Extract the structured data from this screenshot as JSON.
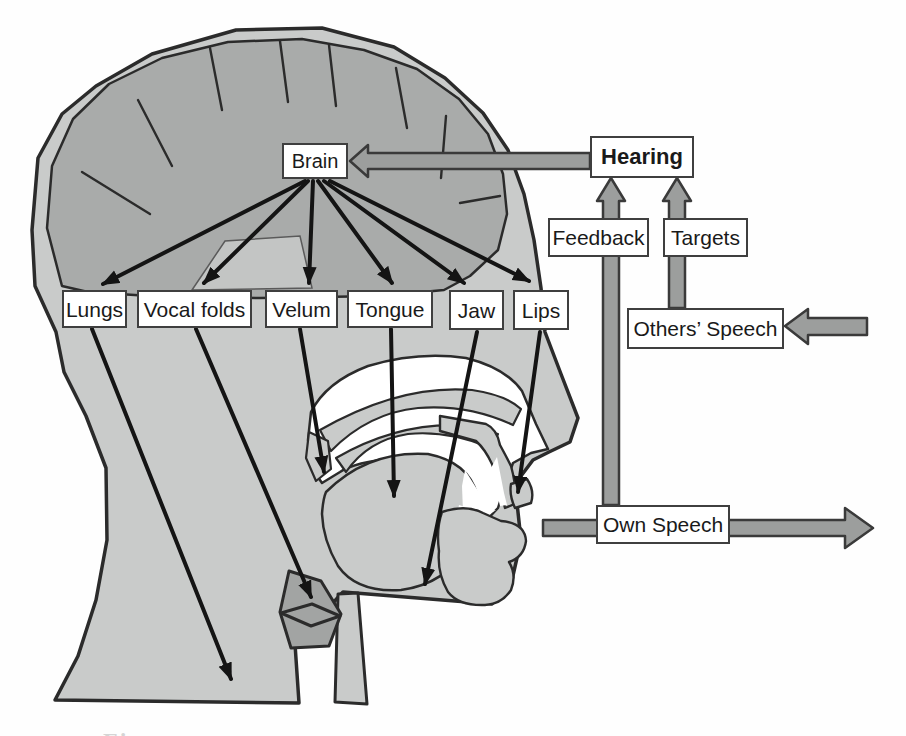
{
  "diagram": {
    "boxes": {
      "brain": {
        "label": "Brain"
      },
      "hearing": {
        "label": "Hearing"
      },
      "feedback": {
        "label": "Feedback"
      },
      "targets": {
        "label": "Targets"
      },
      "others_speech": {
        "label": "Others’ Speech"
      },
      "own_speech": {
        "label": "Own Speech"
      }
    },
    "articulators": [
      {
        "label": "Lungs"
      },
      {
        "label": "Vocal folds"
      },
      {
        "label": "Velum"
      },
      {
        "label": "Tongue"
      },
      {
        "label": "Jaw"
      },
      {
        "label": "Lips"
      }
    ],
    "caption_partial": "Figure",
    "colors": {
      "page": "#fefefe",
      "head": "#c9cbca",
      "brain": "#a9abaa",
      "capsule": "#c3c5c4",
      "larynx": "#a2a4a3",
      "arrow_gray": "#9c9e9d",
      "arrow_gray_border": "#3a3a3a",
      "outline": "#2b2b2b",
      "arrow_black": "#141414",
      "box_bg": "#ffffff",
      "box_border": "#3f3f3f",
      "text": "#1a1a1a"
    }
  }
}
